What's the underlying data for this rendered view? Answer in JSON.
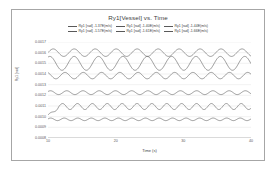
{
  "chart_data": {
    "type": "line",
    "title": "Ry1[Vessel] vs. Time",
    "xlabel": "Time (s)",
    "ylabel": "Ry1 [rad]",
    "xlim": [
      10,
      40
    ],
    "ylim": [
      0.0008,
      0.0017
    ],
    "xticks": [
      "10",
      "20",
      "30",
      "40"
    ],
    "xtick_values": [
      10,
      20,
      30,
      40
    ],
    "yticks": [
      "0.0017",
      "0.0016",
      "0.0015",
      "0.0014",
      "0.0013",
      "0.0012",
      "0.0011",
      "0.0010",
      "0.0009",
      "0.0008"
    ],
    "ytick_values": [
      0.0017,
      0.0016,
      0.0015,
      0.0014,
      0.0013,
      0.0012,
      0.0011,
      0.001,
      0.0009,
      0.0008
    ],
    "grid": true,
    "grid_axis": "y",
    "legend_position": "top",
    "legend_columns": 3,
    "line_color": "#595959",
    "series": [
      {
        "name": "Ry1 [rad] -1.37E(m/s)",
        "mean": 0.0016,
        "amplitude": 3.5e-05,
        "period": 3.1,
        "phase": 0.0,
        "ramp": false
      },
      {
        "name": "Ry1 [rad] -1.40E(m/s)",
        "mean": 0.0015,
        "amplitude": 6.5e-05,
        "period": 3.6,
        "phase": 1.1,
        "ramp": false
      },
      {
        "name": "Ry1 [rad] -1.44E(m/s)",
        "mean": 0.001385,
        "amplitude": 3e-05,
        "period": 2.7,
        "phase": 2.0,
        "ramp": false
      },
      {
        "name": "Ry1 [rad] -1.57E(m/s)",
        "mean": 0.001225,
        "amplitude": 1.8e-05,
        "period": 2.4,
        "phase": 0.6,
        "ramp": false
      },
      {
        "name": "Ry1 [rad] -1.61E(m/s)",
        "mean": 0.001095,
        "amplitude": 2.8e-05,
        "period": 2.2,
        "phase": 1.7,
        "ramp": true
      },
      {
        "name": "Ry1 [rad] -1.66E(m/s)",
        "mean": 0.000975,
        "amplitude": 1.2e-05,
        "period": 2.0,
        "phase": 0.3,
        "ramp": false
      }
    ]
  }
}
